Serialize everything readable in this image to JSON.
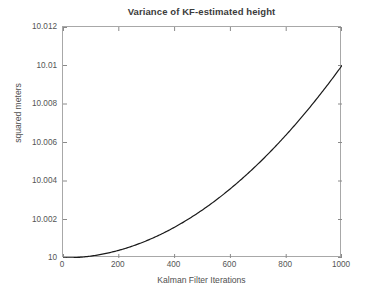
{
  "chart_data": {
    "type": "line",
    "title": "Variance of KF-estimated height",
    "xlabel": "Kalman Filter Iterations",
    "ylabel": "squared meters",
    "xlim": [
      0,
      1000
    ],
    "ylim": [
      10,
      10.012
    ],
    "grid": false,
    "legend": null,
    "line_color": "#1a1a1a",
    "line_width": 1.2,
    "xticks": [
      0,
      200,
      400,
      600,
      800,
      1000
    ],
    "xtick_labels": [
      "0",
      "200",
      "400",
      "600",
      "800",
      "1000"
    ],
    "yticks": [
      10,
      10.002,
      10.004,
      10.006,
      10.008,
      10.01,
      10.012
    ],
    "ytick_labels": [
      "10",
      "10.002",
      "10.004",
      "10.006",
      "10.008",
      "10.01",
      "10.012"
    ],
    "series": [
      {
        "name": "variance",
        "x": [
          0,
          50,
          100,
          150,
          200,
          250,
          300,
          350,
          400,
          450,
          500,
          550,
          600,
          650,
          700,
          750,
          800,
          850,
          900,
          950,
          1000
        ],
        "y": [
          10.0,
          10.000025,
          10.0001,
          10.000225,
          10.0004,
          10.000625,
          10.0009,
          10.001225,
          10.0016,
          10.002025,
          10.0025,
          10.003025,
          10.0036,
          10.004225,
          10.0049,
          10.005625,
          10.0064,
          10.007225,
          10.0081,
          10.009025,
          10.01
        ]
      }
    ]
  },
  "axes": {
    "box_color": "#a8a8a8",
    "tick_color": "#8a8a8a",
    "background": "#ffffff"
  }
}
